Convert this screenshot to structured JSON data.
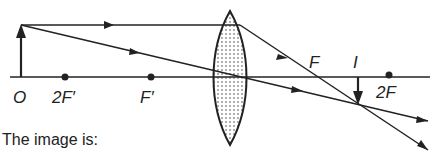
{
  "diagram": {
    "labels": {
      "object": "O",
      "two_f_prime": "2F′",
      "f_prime": "F′",
      "f": "F",
      "image": "I",
      "two_f": "2F"
    },
    "caption": "The image is:",
    "colors": {
      "line": "#222222",
      "lens_fill": "#d8d8d8",
      "background": "#ffffff"
    }
  }
}
